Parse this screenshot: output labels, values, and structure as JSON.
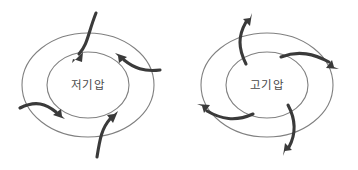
{
  "figure": {
    "background_color": "#ffffff",
    "width": 358,
    "height": 170,
    "isobar_color": "#808080",
    "wind_arrow_color": "#3a3a3a",
    "label_color": "#4a4a4a"
  },
  "diagrams": [
    {
      "id": "low-pressure",
      "label": "저기압",
      "label_x": 88,
      "label_y": 85,
      "circulation": "counterclockwise-inward",
      "isobars": [
        {
          "cx": 88,
          "cy": 85,
          "rx": 66,
          "ry": 52
        },
        {
          "cx": 88,
          "cy": 85,
          "rx": 41,
          "ry": 33
        }
      ],
      "arrows": [
        {
          "id": "arrow-top",
          "tail": "outside-top",
          "head": "inner-upper-left"
        },
        {
          "id": "arrow-right",
          "tail": "outside-right",
          "head": "inner-upper-right"
        },
        {
          "id": "arrow-left",
          "tail": "outside-left",
          "head": "inner-lower-left"
        },
        {
          "id": "arrow-bottom",
          "tail": "outside-bottom",
          "head": "inner-lower-right"
        }
      ]
    },
    {
      "id": "high-pressure",
      "label": "고기압",
      "label_x": 267,
      "label_y": 85,
      "circulation": "clockwise-outward",
      "isobars": [
        {
          "cx": 267,
          "cy": 85,
          "rx": 66,
          "ry": 52
        },
        {
          "cx": 267,
          "cy": 85,
          "rx": 41,
          "ry": 33
        }
      ],
      "arrows": [
        {
          "id": "arrow-top",
          "tail": "inner-upper-left",
          "head": "outside-top"
        },
        {
          "id": "arrow-right",
          "tail": "inner-upper-right",
          "head": "outside-right"
        },
        {
          "id": "arrow-left",
          "tail": "inner-lower-left",
          "head": "outside-left"
        },
        {
          "id": "arrow-bottom",
          "tail": "inner-lower-right",
          "head": "outside-bottom"
        }
      ]
    }
  ]
}
